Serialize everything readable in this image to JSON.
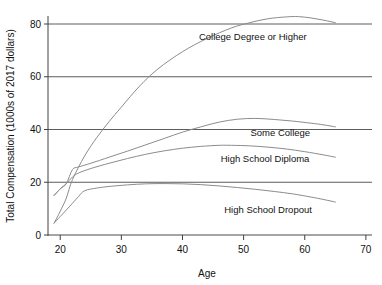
{
  "chart_data": {
    "type": "line",
    "title": "",
    "xlabel": "Age",
    "ylabel": "Total Compensation (1000s of 2017 dollars)",
    "xlim": [
      18,
      71
    ],
    "ylim": [
      0,
      85
    ],
    "xticks": [
      20,
      30,
      40,
      50,
      60,
      70
    ],
    "yticks": [
      0,
      20,
      40,
      60,
      80
    ],
    "grid": "horizontal",
    "legend_position": "inline-right",
    "line_color": "#8c8c8c",
    "axis_color": "#404040",
    "series": [
      {
        "name": "College Degree or Higher",
        "label": "College Degree or Higher",
        "label_x": 51.5,
        "label_y": 74.0,
        "x": [
          19,
          20,
          21,
          22,
          24,
          26,
          28,
          30,
          33,
          36,
          40,
          44,
          48,
          51,
          54,
          57,
          59,
          61,
          63,
          65
        ],
        "y": [
          4.5,
          9.0,
          14.0,
          21.0,
          30.0,
          37.0,
          43.0,
          48.5,
          56.5,
          63.0,
          69.5,
          74.5,
          78.5,
          80.5,
          82.0,
          82.7,
          82.8,
          82.3,
          81.5,
          80.5
        ]
      },
      {
        "name": "Some College",
        "label": "Some College",
        "label_x": 56.0,
        "label_y": 37.5,
        "x": [
          19,
          20,
          21,
          22,
          23,
          25,
          28,
          31,
          34,
          37,
          40,
          43,
          46,
          49,
          52,
          55,
          58,
          61,
          63,
          65
        ],
        "y": [
          15.0,
          17.5,
          19.5,
          24.8,
          25.8,
          27.2,
          29.5,
          31.8,
          34.2,
          36.6,
          39.0,
          41.0,
          42.8,
          43.9,
          44.2,
          43.8,
          43.2,
          42.4,
          41.8,
          41.0
        ]
      },
      {
        "name": "High School Diploma",
        "label": "High School Diploma",
        "label_x": 53.5,
        "label_y": 27.5,
        "x": [
          19,
          20,
          21,
          22,
          23,
          25,
          28,
          31,
          34,
          37,
          40,
          43,
          46,
          48,
          51,
          54,
          57,
          60,
          63,
          65
        ],
        "y": [
          15.0,
          17.5,
          19.5,
          22.0,
          23.5,
          25.2,
          27.2,
          29.0,
          30.6,
          31.9,
          32.9,
          33.6,
          34.0,
          34.0,
          33.8,
          33.3,
          32.6,
          31.6,
          30.4,
          29.5
        ]
      },
      {
        "name": "High School Dropout",
        "label": "High School Dropout",
        "label_x": 54.0,
        "label_y": 8.5,
        "x": [
          19,
          20,
          21,
          22,
          23,
          24,
          26,
          28,
          31,
          34,
          37,
          40,
          43,
          46,
          49,
          52,
          55,
          58,
          61,
          63,
          65
        ],
        "y": [
          4.5,
          7.0,
          9.5,
          12.0,
          14.6,
          16.8,
          17.8,
          18.4,
          19.0,
          19.4,
          19.5,
          19.4,
          19.1,
          18.6,
          18.0,
          17.3,
          16.5,
          15.6,
          14.4,
          13.5,
          12.5
        ]
      }
    ]
  },
  "axes": {
    "x_tick_labels": [
      "20",
      "30",
      "40",
      "50",
      "60",
      "70"
    ],
    "y_tick_labels": [
      "0",
      "20",
      "40",
      "60",
      "80"
    ],
    "x_title": "Age",
    "y_title": "Total Compensation (1000s of 2017 dollars)"
  }
}
